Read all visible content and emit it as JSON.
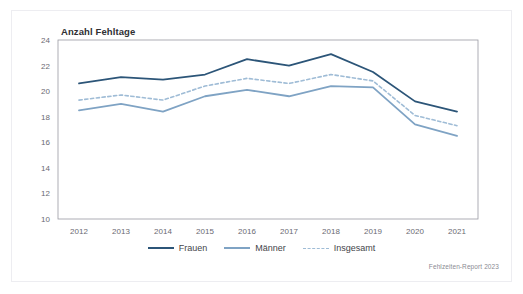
{
  "chart_data": {
    "type": "line",
    "title": "Anzahl Fehltage",
    "xlabel": "",
    "ylabel": "Anzahl Fehltage",
    "categories": [
      "2012",
      "2013",
      "2014",
      "2015",
      "2016",
      "2017",
      "2018",
      "2019",
      "2020",
      "2021"
    ],
    "x": [
      2012,
      2013,
      2014,
      2015,
      2016,
      2017,
      2018,
      2019,
      2020,
      2021
    ],
    "ylim": [
      10,
      24
    ],
    "yticks": [
      10,
      12,
      14,
      16,
      18,
      20,
      22,
      24
    ],
    "ytick_labels": [
      "10",
      "12",
      "14",
      "16",
      "18",
      "20",
      "22",
      "24"
    ],
    "grid": false,
    "legend_position": "bottom",
    "series": [
      {
        "name": "Frauen",
        "style": "solid",
        "color": "#2c5578",
        "values": [
          20.6,
          21.1,
          20.9,
          21.3,
          22.5,
          22.0,
          22.9,
          21.5,
          19.2,
          18.4
        ]
      },
      {
        "name": "Männer",
        "style": "solid",
        "color": "#7fa3c4",
        "values": [
          18.5,
          19.0,
          18.4,
          19.6,
          20.1,
          19.6,
          20.4,
          20.3,
          17.4,
          16.5
        ]
      },
      {
        "name": "Insgesamt",
        "style": "dashed",
        "color": "#9fbcd6",
        "values": [
          19.3,
          19.7,
          19.3,
          20.4,
          21.0,
          20.6,
          21.3,
          20.8,
          18.1,
          17.3
        ]
      }
    ],
    "annotations": [
      "Fehlzeiten-Report 2023"
    ]
  },
  "figure": {
    "title": "Anzahl Fehltage",
    "source_note": "Fehlzeiten-Report 2023"
  },
  "legend": {
    "items": [
      {
        "label": "Frauen"
      },
      {
        "label": "Männer"
      },
      {
        "label": "Insgesamt"
      }
    ]
  },
  "colors": {
    "frauen": "#2c5578",
    "maenner": "#7fa3c4",
    "insgesamt": "#9fbcd6",
    "axis": "#9a9aa2",
    "tick_text": "#6a6a72",
    "card_border": "#ededf1"
  }
}
